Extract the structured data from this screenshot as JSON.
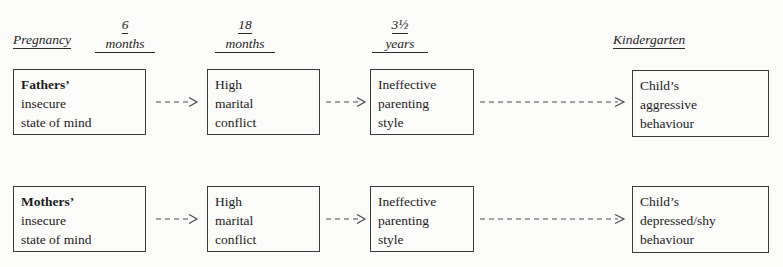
{
  "diagram": {
    "title_present": false,
    "background_color": "#fbfbfa",
    "line_color": "#3a3a3a",
    "text_color": "#1c1c1c",
    "columns": [
      {
        "id": "pregnancy",
        "top_label": "",
        "bottom_label": "Pregnancy"
      },
      {
        "id": "six-months",
        "top_label": "6",
        "bottom_label": "months"
      },
      {
        "id": "eighteen-months",
        "top_label": "18",
        "bottom_label": "months"
      },
      {
        "id": "three-and-half-years",
        "top_label": "3½",
        "bottom_label": "years"
      },
      {
        "id": "kindergarten",
        "top_label": "",
        "bottom_label": "Kindergarten"
      }
    ],
    "rows": [
      {
        "id": "fathers-pathway",
        "nodes": [
          {
            "id": "fathers-state-of-mind",
            "lines": [
              "Fathers’",
              "insecure",
              "state of mind"
            ],
            "bold_first_line": true
          },
          {
            "id": "fathers-marital-conflict",
            "lines": [
              "High",
              "marital",
              "conflict"
            ],
            "bold_first_line": false
          },
          {
            "id": "fathers-parenting-style",
            "lines": [
              "Ineffective",
              "parenting",
              "style"
            ],
            "bold_first_line": false
          },
          {
            "id": "child-aggressive-behaviour",
            "lines": [
              "Child’s",
              "aggressive",
              "behaviour"
            ],
            "bold_first_line": false
          }
        ],
        "arrows": [
          "dashed-arrow",
          "dashed-arrow",
          "dashed-arrow"
        ]
      },
      {
        "id": "mothers-pathway",
        "nodes": [
          {
            "id": "mothers-state-of-mind",
            "lines": [
              "Mothers’",
              "insecure",
              "state of mind"
            ],
            "bold_first_line": true
          },
          {
            "id": "mothers-marital-conflict",
            "lines": [
              "High",
              "marital",
              "conflict"
            ],
            "bold_first_line": false
          },
          {
            "id": "mothers-parenting-style",
            "lines": [
              "Ineffective",
              "parenting",
              "style"
            ],
            "bold_first_line": false
          },
          {
            "id": "child-depressed-shy-behaviour",
            "lines": [
              "Child’s",
              "depressed/shy",
              "behaviour"
            ],
            "bold_first_line": false
          }
        ],
        "arrows": [
          "dashed-arrow",
          "dashed-arrow",
          "dashed-arrow"
        ]
      }
    ]
  }
}
